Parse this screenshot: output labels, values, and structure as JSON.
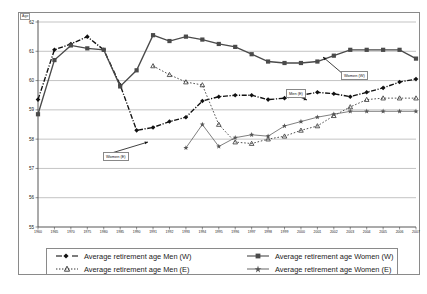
{
  "figure": {
    "unit_label": "Age",
    "caption": ""
  },
  "chart_data": {
    "type": "line",
    "title": "",
    "xlabel": "",
    "ylabel": "Age",
    "ylim": [
      55,
      62
    ],
    "yticks": [
      55,
      56,
      57,
      58,
      59,
      60,
      61,
      62
    ],
    "grid": true,
    "legend_position": "bottom",
    "x": [
      1960,
      1965,
      1970,
      1975,
      1980,
      1985,
      1990,
      1991,
      1992,
      1993,
      1994,
      1995,
      1996,
      1997,
      1998,
      1999,
      2000,
      2001,
      2002,
      2003,
      2004,
      2005,
      2006,
      2007
    ],
    "categories": [
      "1960",
      "1965",
      "1970",
      "1975",
      "1980",
      "1985",
      "1990",
      "1991",
      "1992",
      "1993",
      "1994",
      "1995",
      "1996",
      "1997",
      "1998",
      "1999",
      "2000",
      "2001",
      "2002",
      "2003",
      "2004",
      "2005",
      "2006",
      "2007"
    ],
    "series": [
      {
        "name": "Average retirement age Men (W)",
        "key": "men_w",
        "marker": "diamond",
        "linestyle": "dash-dot",
        "color": "#111111",
        "values": [
          59.35,
          61.05,
          61.25,
          61.5,
          61.05,
          59.85,
          58.3,
          58.4,
          58.6,
          58.75,
          59.3,
          59.45,
          59.5,
          59.5,
          59.35,
          59.4,
          59.5,
          59.6,
          59.55,
          59.45,
          59.6,
          59.75,
          59.95,
          60.05
        ]
      },
      {
        "name": "Average retirement age Women (W)",
        "key": "women_w",
        "marker": "square",
        "linestyle": "solid",
        "color": "#4a4a4a",
        "values": [
          58.85,
          60.7,
          61.2,
          61.1,
          61.05,
          59.8,
          60.35,
          61.55,
          61.35,
          61.5,
          61.4,
          61.25,
          61.15,
          60.9,
          60.65,
          60.6,
          60.6,
          60.65,
          60.85,
          61.05,
          61.05,
          61.05,
          61.05,
          60.75
        ]
      },
      {
        "name": "Average retirement age Men (E)",
        "key": "men_e",
        "marker": "triangle",
        "linestyle": "dotted",
        "color": "#333333",
        "values": [
          null,
          null,
          null,
          null,
          null,
          null,
          null,
          60.5,
          60.2,
          59.95,
          59.85,
          58.5,
          57.9,
          57.85,
          58.0,
          58.1,
          58.3,
          58.45,
          58.8,
          59.1,
          59.35,
          59.4,
          59.4,
          59.4
        ]
      },
      {
        "name": "Average retirement age Women (E)",
        "key": "women_e",
        "marker": "star",
        "linestyle": "solid-thin",
        "color": "#555555",
        "values": [
          null,
          null,
          null,
          null,
          null,
          null,
          null,
          null,
          null,
          57.7,
          58.5,
          57.75,
          58.05,
          58.15,
          58.1,
          58.45,
          58.6,
          58.75,
          58.85,
          58.95,
          58.95,
          58.95,
          58.95,
          58.95
        ]
      }
    ],
    "annotations": [
      {
        "text": "Women (W)",
        "key": "women_w",
        "x_px": 341,
        "y_px": 71,
        "arrow_to_x": 323,
        "arrow_to_y": 57
      },
      {
        "text": "Men (E)",
        "key": "men_e",
        "x_px": 286,
        "y_px": 89,
        "arrow_to_x": 307,
        "arrow_to_y": 100
      },
      {
        "text": "Women (E)",
        "key": "women_e",
        "x_px": 103,
        "y_px": 152,
        "arrow_to_x": 148,
        "arrow_to_y": 142
      }
    ]
  },
  "legend": {
    "items": [
      {
        "label": "Average retirement age Men (W)",
        "key": "men_w"
      },
      {
        "label": "Average retirement age Women (W)",
        "key": "women_w"
      },
      {
        "label": "Average retirement age Men (E)",
        "key": "men_e"
      },
      {
        "label": "Average retirement age Women (E)",
        "key": "women_e"
      }
    ]
  }
}
